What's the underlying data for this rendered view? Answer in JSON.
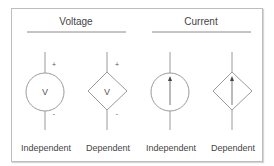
{
  "groups": [
    {
      "title": "Voltage",
      "sources": [
        {
          "label": "Independent",
          "shape": "circle",
          "symbol": "V",
          "plus": "+",
          "minus": "-"
        },
        {
          "label": "Dependent",
          "shape": "diamond",
          "symbol": "V",
          "plus": "+",
          "minus": "-"
        }
      ]
    },
    {
      "title": "Current",
      "sources": [
        {
          "label": "Independent",
          "shape": "circle",
          "symbol": "arrow-up"
        },
        {
          "label": "Dependent",
          "shape": "diamond",
          "symbol": "arrow-up"
        }
      ]
    }
  ],
  "colors": {
    "line": "#9a9a9a",
    "text": "#444444",
    "frame": "#bdbdbd"
  }
}
